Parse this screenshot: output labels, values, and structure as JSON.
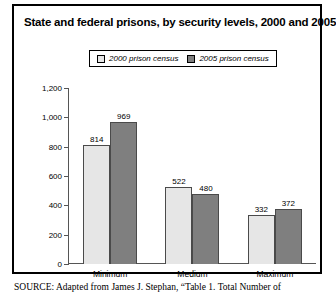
{
  "figure": {
    "title": "State and federal prisons, by security levels, 2000 and 2005",
    "source_kicker": "SOURCE:",
    "source_text": "Adapted from James J. Stephan, “Table 1. Total Number of",
    "frame_color": "#000000"
  },
  "chart_data": {
    "type": "bar",
    "title": "State and federal prisons, by security levels, 2000 and 2005",
    "xlabel": "",
    "ylabel": "",
    "categories": [
      "Minimum",
      "Medium",
      "Maximum"
    ],
    "series": [
      {
        "name": "2000 prison census",
        "color": "#e6e6e6",
        "values": [
          814,
          522,
          332
        ]
      },
      {
        "name": "2005 prison census",
        "color": "#7f7f7f",
        "values": [
          969,
          480,
          372
        ]
      }
    ],
    "ylim": [
      0,
      1200
    ],
    "yticks": [
      0,
      200,
      400,
      600,
      800,
      1000,
      1200
    ],
    "ytick_labels": [
      "0",
      "200",
      "400",
      "600",
      "800",
      "1,000",
      "1,200"
    ],
    "grid": false,
    "legend_position": "top-center",
    "data_labels": true
  }
}
